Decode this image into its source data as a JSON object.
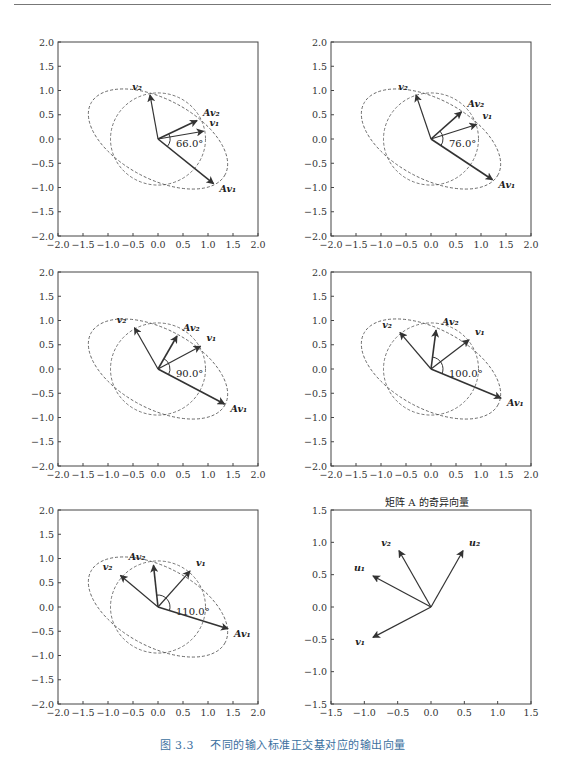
{
  "figure": {
    "caption_number": "图 3.3",
    "caption_text": "不同的输入标准正交基对应的输出向量",
    "caption_color": "#3b6fa0"
  },
  "chart_data": [
    {
      "type": "vector",
      "panel": "top-left",
      "xlim": [
        -2,
        2
      ],
      "ylim": [
        -2,
        2
      ],
      "xticks": [
        "−2.0",
        "−1.5",
        "−1.0",
        "−0.5",
        "0.0",
        "0.5",
        "1.0",
        "1.5",
        "2.0"
      ],
      "yticks": [
        "2.0",
        "1.5",
        "1.0",
        "0.5",
        "0.0",
        "−0.5",
        "−1.0",
        "−1.5",
        "−2.0"
      ],
      "angle_label": "66.0°",
      "vectors": [
        {
          "name": "v1",
          "label": "v₁",
          "x": 0.91,
          "y": 0.16,
          "bold": false
        },
        {
          "name": "v2",
          "label": "v₂",
          "x": -0.16,
          "y": 0.91,
          "bold": false
        },
        {
          "name": "Av1",
          "label": "Av₁",
          "x": 1.11,
          "y": -0.92,
          "bold": true
        },
        {
          "name": "Av2",
          "label": "Av₂",
          "x": 0.78,
          "y": 0.38,
          "bold": true
        }
      ]
    },
    {
      "type": "vector",
      "panel": "top-right",
      "xlim": [
        -2,
        2
      ],
      "ylim": [
        -2,
        2
      ],
      "xticks": [
        "−2.0",
        "−1.5",
        "−1.0",
        "−0.5",
        "0.0",
        "0.5",
        "1.0",
        "1.5",
        "2.0"
      ],
      "yticks": [
        "2.0",
        "1.5",
        "1.0",
        "0.5",
        "0.0",
        "−0.5",
        "−1.0",
        "−1.5",
        "−2.0"
      ],
      "angle_label": "76.0°",
      "vectors": [
        {
          "name": "v1",
          "label": "v₁",
          "x": 0.91,
          "y": 0.3,
          "bold": false
        },
        {
          "name": "v2",
          "label": "v₂",
          "x": -0.3,
          "y": 0.91,
          "bold": false
        },
        {
          "name": "Av1",
          "label": "Av₁",
          "x": 1.23,
          "y": -0.84,
          "bold": true
        },
        {
          "name": "Av2",
          "label": "Av₂",
          "x": 0.61,
          "y": 0.56,
          "bold": true
        }
      ]
    },
    {
      "type": "vector",
      "panel": "middle-left",
      "xlim": [
        -2,
        2
      ],
      "ylim": [
        -2,
        2
      ],
      "xticks": [
        "−2.0",
        "−1.5",
        "−1.0",
        "−0.5",
        "0.0",
        "0.5",
        "1.0",
        "1.5",
        "2.0"
      ],
      "yticks": [
        "2.0",
        "1.5",
        "1.0",
        "0.5",
        "0.0",
        "−0.5",
        "−1.0",
        "−1.5",
        "−2.0"
      ],
      "angle_label": "90.0°",
      "vectors": [
        {
          "name": "v1",
          "label": "v₁",
          "x": 0.85,
          "y": 0.47,
          "bold": false
        },
        {
          "name": "v2",
          "label": "v₂",
          "x": -0.47,
          "y": 0.85,
          "bold": false
        },
        {
          "name": "Av1",
          "label": "Av₁",
          "x": 1.33,
          "y": -0.72,
          "bold": true
        },
        {
          "name": "Av2",
          "label": "Av₂",
          "x": 0.38,
          "y": 0.68,
          "bold": true
        }
      ]
    },
    {
      "type": "vector",
      "panel": "middle-right",
      "xlim": [
        -2,
        2
      ],
      "ylim": [
        -2,
        2
      ],
      "xticks": [
        "−2.0",
        "−1.5",
        "−1.0",
        "−0.5",
        "0.0",
        "0.5",
        "1.0",
        "1.5",
        "2.0"
      ],
      "yticks": [
        "2.0",
        "1.5",
        "1.0",
        "0.5",
        "0.0",
        "−0.5",
        "−1.0",
        "−1.5",
        "−2.0"
      ],
      "angle_label": "100.0°",
      "vectors": [
        {
          "name": "v1",
          "label": "v₁",
          "x": 0.76,
          "y": 0.6,
          "bold": false
        },
        {
          "name": "v2",
          "label": "v₂",
          "x": -0.62,
          "y": 0.75,
          "bold": false
        },
        {
          "name": "Av1",
          "label": "Av₁",
          "x": 1.4,
          "y": -0.6,
          "bold": true
        },
        {
          "name": "Av2",
          "label": "Av₂",
          "x": 0.1,
          "y": 0.8,
          "bold": true
        }
      ]
    },
    {
      "type": "vector",
      "panel": "bottom-left",
      "xlim": [
        -2,
        2
      ],
      "ylim": [
        -2,
        2
      ],
      "xticks": [
        "−2.0",
        "−1.5",
        "−1.0",
        "−0.5",
        "0.0",
        "0.5",
        "1.0",
        "1.5",
        "2.0"
      ],
      "yticks": [
        "2.0",
        "1.5",
        "1.0",
        "0.5",
        "0.0",
        "−0.5",
        "−1.0",
        "−1.5",
        "−2.0"
      ],
      "angle_label": "110.0°",
      "vectors": [
        {
          "name": "v1",
          "label": "v₁",
          "x": 0.64,
          "y": 0.74,
          "bold": false
        },
        {
          "name": "v2",
          "label": "v₂",
          "x": -0.75,
          "y": 0.65,
          "bold": false
        },
        {
          "name": "Av1",
          "label": "Av₁",
          "x": 1.4,
          "y": -0.45,
          "bold": true
        },
        {
          "name": "Av2",
          "label": "Av₂",
          "x": -0.09,
          "y": 0.86,
          "bold": true
        }
      ]
    },
    {
      "type": "vector",
      "panel": "bottom-right",
      "title": "矩阵 A 的奇异向量",
      "xlim": [
        -1.5,
        1.5
      ],
      "ylim": [
        -1.5,
        1.5
      ],
      "xticks": [
        "−1.5",
        "−1.0",
        "−0.5",
        "0.0",
        "0.5",
        "1.0",
        "1.5"
      ],
      "yticks": [
        "1.5",
        "1.0",
        "0.5",
        "0.0",
        "−0.5",
        "−1.0",
        "−1.5"
      ],
      "vectors": [
        {
          "name": "u1",
          "label": "u₁",
          "x": -0.87,
          "y": 0.48,
          "bold": false
        },
        {
          "name": "u2",
          "label": "u₂",
          "x": 0.48,
          "y": 0.87,
          "bold": false
        },
        {
          "name": "v1",
          "label": "v₁",
          "x": -0.87,
          "y": -0.47,
          "bold": false
        },
        {
          "name": "v2",
          "label": "v₂",
          "x": -0.48,
          "y": 0.87,
          "bold": false
        }
      ]
    }
  ],
  "panel_titles": {
    "bottom_right": "矩阵 A 的奇异向量"
  }
}
